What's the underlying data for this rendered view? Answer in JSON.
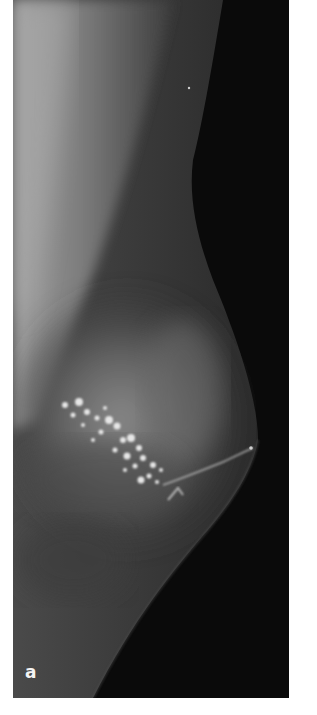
{
  "figure": {
    "panel_label": "a",
    "content": "mammogram (mediolateral view) showing clustered bright microcalcifications",
    "colors": {
      "background": "#0b0b0b",
      "tissue": "#5a5a5a",
      "pectoral": "#8a8a8a",
      "calcification": "#e6e6e6",
      "label": "#f4f4f4"
    }
  }
}
